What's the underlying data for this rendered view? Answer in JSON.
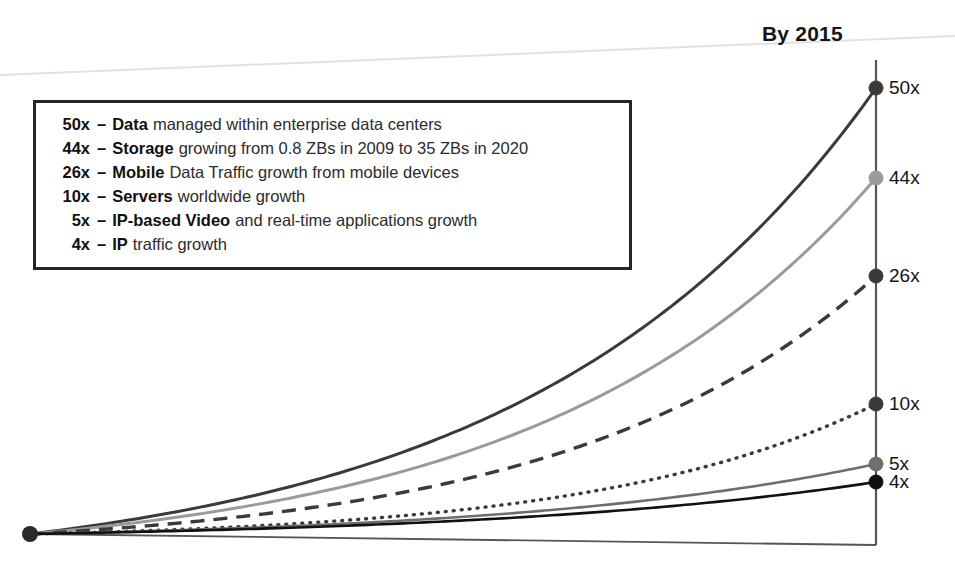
{
  "title": "By 2015",
  "legend": {
    "rows": [
      {
        "multiplier": "50x",
        "sep": "–",
        "term": "Data",
        "desc": "managed within enterprise data centers"
      },
      {
        "multiplier": "44x",
        "sep": "–",
        "term": "Storage",
        "desc": "growing from 0.8 ZBs in 2009 to 35 ZBs in 2020"
      },
      {
        "multiplier": "26x",
        "sep": "–",
        "term": "Mobile",
        "desc": "Data Traffic growth from mobile devices"
      },
      {
        "multiplier": "10x",
        "sep": "–",
        "term": "Servers",
        "desc": "worldwide growth"
      },
      {
        "multiplier": "5x",
        "sep": "–",
        "term": "IP-based Video",
        "desc": "and real-time applications growth"
      },
      {
        "multiplier": "4x",
        "sep": "–",
        "term": "IP",
        "desc": "traffic growth"
      }
    ]
  },
  "axis_labels": [
    {
      "text": "50x",
      "y": 88
    },
    {
      "text": "44x",
      "y": 178
    },
    {
      "text": "26x",
      "y": 276
    },
    {
      "text": "10x",
      "y": 404
    },
    {
      "text": "5x",
      "y": 464
    },
    {
      "text": "4x",
      "y": 482
    }
  ],
  "colors": {
    "curve_50x": "#3a3a3a",
    "curve_44x": "#9a9a9a",
    "curve_26x": "#3a3a3a",
    "curve_10x": "#3a3a3a",
    "curve_5x": "#6e6e6e",
    "curve_4x": "#111111",
    "axis": "#555555",
    "legend_border": "#262626",
    "text": "#141414"
  },
  "chart_data": {
    "type": "line",
    "title": "By 2015",
    "xlabel": "",
    "ylabel": "",
    "grid": false,
    "legend_position": "inset-top-left",
    "x": [
      0,
      1
    ],
    "xlim": [
      0,
      1
    ],
    "ylim": [
      0,
      50
    ],
    "note": "Exponential growth curves all originating from a common point at the left baseline and terminating at labelled endpoints on the right vertical axis.",
    "series": [
      {
        "name": "Data managed within enterprise data centers",
        "short": "Data",
        "end_value": 50,
        "label": "50x",
        "style": "solid",
        "color": "#3a3a3a",
        "width": 3.0
      },
      {
        "name": "Storage growing from 0.8 ZBs in 2009 to 35 ZBs in 2020",
        "short": "Storage",
        "end_value": 44,
        "label": "44x",
        "style": "solid",
        "color": "#9a9a9a",
        "width": 3.0
      },
      {
        "name": "Mobile Data Traffic growth from mobile devices",
        "short": "Mobile",
        "end_value": 26,
        "label": "26x",
        "style": "dashed",
        "color": "#3a3a3a",
        "width": 3.4
      },
      {
        "name": "Servers worldwide growth",
        "short": "Servers",
        "end_value": 10,
        "label": "10x",
        "style": "dotted",
        "color": "#3a3a3a",
        "width": 3.4
      },
      {
        "name": "IP-based Video and real-time applications growth",
        "short": "IP-based Video",
        "end_value": 5,
        "label": "5x",
        "style": "solid",
        "color": "#6e6e6e",
        "width": 2.6
      },
      {
        "name": "IP traffic growth",
        "short": "IP",
        "end_value": 4,
        "label": "4x",
        "style": "solid",
        "color": "#111111",
        "width": 2.6
      }
    ]
  }
}
